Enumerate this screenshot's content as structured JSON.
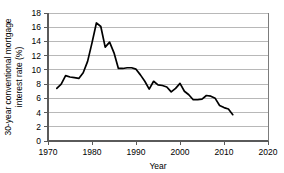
{
  "chart_data": {
    "type": "line",
    "title": "",
    "xlabel": "Year",
    "ylabel": "30-year conventional mortgage interest rate (%)",
    "ylabel_line1": "30-year conventional mortgage",
    "ylabel_line2": "interest rate (%)",
    "xlim": [
      1970,
      2020
    ],
    "ylim": [
      0,
      18
    ],
    "xticks": [
      1970,
      1980,
      1990,
      2000,
      2010,
      2020
    ],
    "yticks": [
      0,
      2,
      4,
      6,
      8,
      10,
      12,
      14,
      16,
      18
    ],
    "xtick_labels": [
      "1970",
      "1980",
      "1990",
      "2000",
      "2010",
      "2020"
    ],
    "ytick_labels": [
      "0",
      "2",
      "4",
      "6",
      "8",
      "10",
      "12",
      "14",
      "16",
      "18"
    ],
    "grid": "horizontal",
    "legend": "none",
    "line_color": "#000000",
    "grid_color": "#9a9a9a",
    "background_color": "#ffffff",
    "series": [
      {
        "name": "30-year conventional mortgage interest rate",
        "x": [
          1972,
          1973,
          1974,
          1975,
          1976,
          1977,
          1978,
          1979,
          1980,
          1981,
          1982,
          1983,
          1984,
          1985,
          1986,
          1987,
          1988,
          1989,
          1990,
          1991,
          1992,
          1993,
          1994,
          1995,
          1996,
          1997,
          1998,
          1999,
          2000,
          2001,
          2002,
          2003,
          2004,
          2005,
          2006,
          2007,
          2008,
          2009,
          2010,
          2011,
          2012
        ],
        "values": [
          7.4,
          8.0,
          9.2,
          9.0,
          8.9,
          8.8,
          9.6,
          11.2,
          13.8,
          16.6,
          16.1,
          13.2,
          13.9,
          12.4,
          10.2,
          10.2,
          10.3,
          10.3,
          10.1,
          9.3,
          8.4,
          7.3,
          8.4,
          7.9,
          7.8,
          7.6,
          6.9,
          7.4,
          8.1,
          7.0,
          6.5,
          5.8,
          5.8,
          5.9,
          6.4,
          6.3,
          6.0,
          5.0,
          4.7,
          4.5,
          3.7
        ]
      }
    ]
  }
}
